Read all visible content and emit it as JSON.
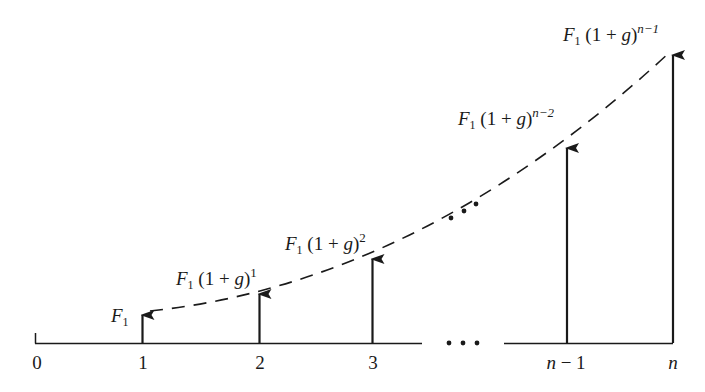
{
  "diagram": {
    "type": "growing-annuity-cash-flow-timeline",
    "colors": {
      "ink": "#1a1a1a",
      "background": "#ffffff"
    },
    "axis": {
      "gap_ellipsis": "• • •",
      "ticks": [
        {
          "id": "0",
          "label": "0",
          "italic": false
        },
        {
          "id": "1",
          "label": "1",
          "italic": false
        },
        {
          "id": "2",
          "label": "2",
          "italic": false
        },
        {
          "id": "3",
          "label": "3",
          "italic": false
        },
        {
          "id": "n-1",
          "label_var": "n",
          "label_rest": " − 1",
          "italic": true
        },
        {
          "id": "n",
          "label_var": "n",
          "label_rest": "",
          "italic": true
        }
      ]
    },
    "curve": {
      "style": "dashed",
      "mid_ellipsis": "• • •"
    },
    "cash_flows": [
      {
        "period": "1",
        "base": "F",
        "base_sub": "1",
        "growth": "",
        "exponent": ""
      },
      {
        "period": "2",
        "base": "F",
        "base_sub": "1",
        "growth": " (1 + ",
        "growth_var": "g",
        "growth_close": ")",
        "exponent": "1"
      },
      {
        "period": "3",
        "base": "F",
        "base_sub": "1",
        "growth": " (1 + ",
        "growth_var": "g",
        "growth_close": ")",
        "exponent": "2"
      },
      {
        "period": "n-1",
        "base": "F",
        "base_sub": "1",
        "growth": " (1 + ",
        "growth_var": "g",
        "growth_close": ")",
        "exponent": "n−2"
      },
      {
        "period": "n",
        "base": "F",
        "base_sub": "1",
        "growth": " (1 + ",
        "growth_var": "g",
        "growth_close": ")",
        "exponent": "n−1"
      }
    ]
  }
}
